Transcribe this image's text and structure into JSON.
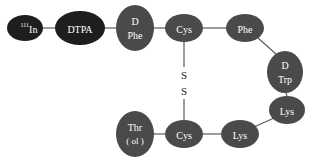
{
  "diagram": {
    "title": "",
    "colors": {
      "dark_node": "#1e1e1e",
      "gray_node": "#4a4a4a",
      "edge": "#5a5a5a",
      "label": "#ffffff",
      "disulfide_text": "#222222"
    },
    "nodes": [
      {
        "id": "in111",
        "label_sup": "111",
        "label": "In",
        "shape": "ellipse"
      },
      {
        "id": "dtpa",
        "label": "DTPA",
        "shape": "ellipse"
      },
      {
        "id": "dphe",
        "line1": "D",
        "line2": "Phe",
        "shape": "ellipse"
      },
      {
        "id": "cys_top",
        "label": "Cys",
        "shape": "ellipse"
      },
      {
        "id": "phe",
        "label": "Phe",
        "shape": "ellipse"
      },
      {
        "id": "dtrp",
        "line1": "D",
        "line2": "Trp",
        "shape": "ellipse"
      },
      {
        "id": "lys_right",
        "label": "Lys",
        "shape": "ellipse"
      },
      {
        "id": "lys_bottom",
        "label": "Lys",
        "shape": "ellipse"
      },
      {
        "id": "cys_bottom",
        "label": "Cys",
        "shape": "ellipse"
      },
      {
        "id": "throl",
        "line1": "Thr",
        "line2": "( ol )",
        "shape": "ellipse"
      }
    ],
    "edges": [
      [
        "in111",
        "dtpa"
      ],
      [
        "dtpa",
        "dphe"
      ],
      [
        "dphe",
        "cys_top"
      ],
      [
        "cys_top",
        "phe"
      ],
      [
        "phe",
        "dtrp"
      ],
      [
        "dtrp",
        "lys_right"
      ],
      [
        "lys_right",
        "lys_bottom"
      ],
      [
        "lys_bottom",
        "cys_bottom"
      ],
      [
        "cys_bottom",
        "throl"
      ],
      [
        "cys_top",
        "cys_bottom"
      ]
    ],
    "disulfide": {
      "s1": "S",
      "s2": "S"
    }
  }
}
